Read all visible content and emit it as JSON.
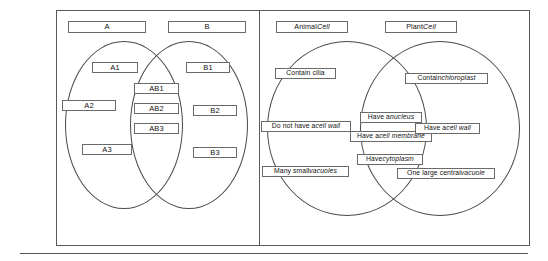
{
  "figure": {
    "panels": [
      {
        "id": "generic-venn",
        "name": "Generic A-B Venn diagram",
        "titles": [
          {
            "label": "A"
          },
          {
            "label": "B"
          }
        ],
        "left_only": [
          {
            "label": "A1"
          },
          {
            "label": "A2"
          },
          {
            "label": "A3"
          }
        ],
        "intersection": [
          {
            "label": "AB1"
          },
          {
            "label": "AB2"
          },
          {
            "label": "AB3"
          }
        ],
        "right_only": [
          {
            "label": "B1"
          },
          {
            "label": "B2"
          },
          {
            "label": "B3"
          }
        ]
      },
      {
        "id": "cell-venn",
        "name": "Animal Cell vs Plant Cell Venn diagram",
        "titles": [
          {
            "head": "Animal ",
            "tail": "Cell"
          },
          {
            "head": "Plant ",
            "tail": "Cell"
          }
        ],
        "left_only": [
          {
            "head": "Contain cilia",
            "tail": ""
          },
          {
            "head": "Do not have a ",
            "tail": "cell wall"
          },
          {
            "head": "Many small ",
            "tail": "vacuoles"
          }
        ],
        "intersection": [
          {
            "head": "Have a ",
            "tail": "nucleus"
          },
          {
            "head": "Have a ",
            "tail": "cell membrane"
          },
          {
            "head": "Have ",
            "tail": "cytoplasm"
          }
        ],
        "right_only": [
          {
            "head": "Contain ",
            "tail": "chloroplast"
          },
          {
            "head": "Have a ",
            "tail": "cell wall"
          },
          {
            "head": "One large central ",
            "tail": "vacuole"
          }
        ]
      }
    ]
  },
  "colors": {
    "frame": "#5a5a5a",
    "circle": "#4a4a4a",
    "box_border": "#6a6a6a",
    "text": "#111111",
    "background": "#ffffff"
  }
}
